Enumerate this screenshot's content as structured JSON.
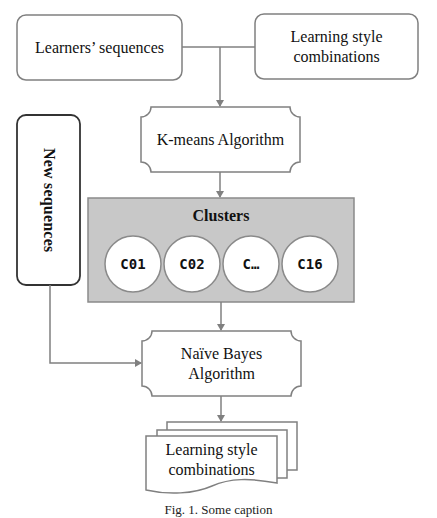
{
  "diagram": {
    "inputs": {
      "learners_sequences": "Learners’ sequences",
      "learning_style_combinations": "Learning style combinations",
      "learning_style_line1": "Learning style",
      "learning_style_line2": "combinations"
    },
    "kmeans": {
      "label": "K-means Algorithm"
    },
    "clusters": {
      "title": "Clusters",
      "items": [
        "C01",
        "C02",
        "C…",
        "C16"
      ]
    },
    "new_sequences": {
      "label": "New sequences"
    },
    "naive_bayes": {
      "line1": "Naïve Bayes",
      "line2": "Algorithm"
    },
    "output": {
      "line1": "Learning style",
      "line2": "combinations"
    },
    "caption": "Fig. 1. Some caption",
    "colors": {
      "stroke": "#808080",
      "clusters_fill": "#c8c8c8",
      "new_sequences_stroke": "#333333",
      "circle_fill": "#ffffff"
    }
  }
}
